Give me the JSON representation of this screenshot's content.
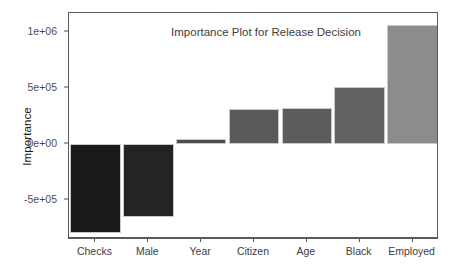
{
  "chart_data": {
    "type": "bar",
    "title": "Importance Plot for Release Decision",
    "xlabel": "",
    "ylabel": "Importance",
    "categories": [
      "Checks",
      "Male",
      "Year",
      "Citizen",
      "Age",
      "Black",
      "Employed"
    ],
    "values": [
      -794000,
      -652000,
      47000,
      310000,
      321000,
      509000,
      1063000
    ],
    "bar_colors": [
      "#1a1a1a",
      "#242424",
      "#4d4d4d",
      "#5a5a5a",
      "#5c5c5c",
      "#636363",
      "#8c8c8c"
    ],
    "ylim": [
      -880000,
      1150000
    ],
    "yticks": [
      1000000,
      500000,
      0,
      -500000
    ],
    "ytick_labels": [
      "1e+06",
      "5e+05",
      "0e+00",
      "-5e+05"
    ],
    "grid": false,
    "legend": "none",
    "baseline": 0
  },
  "axis": {
    "y_title": "Importance"
  }
}
